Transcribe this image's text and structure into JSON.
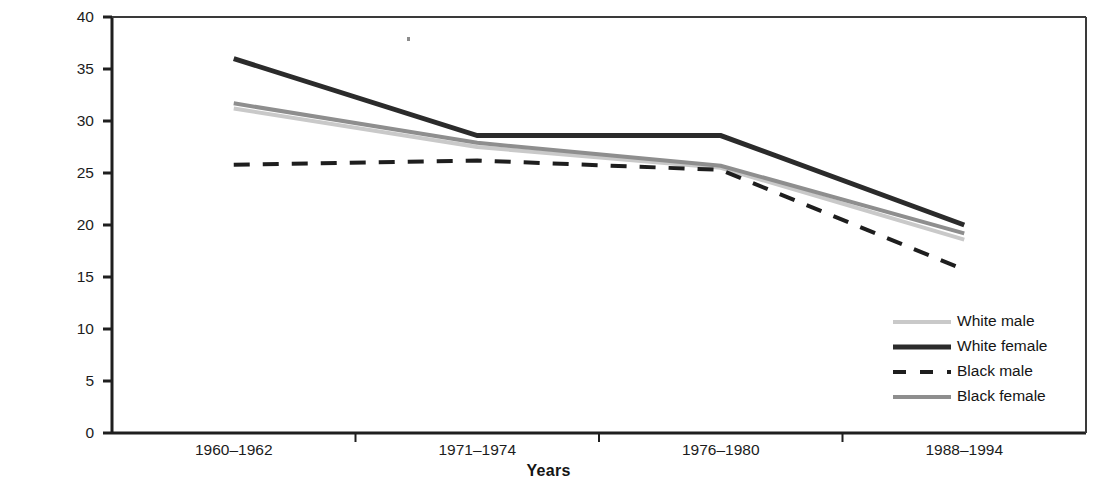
{
  "chart_data": {
    "type": "line",
    "title": "",
    "xlabel": "Years",
    "ylabel": "Percent with High Serum Cholesterol",
    "categories": [
      "1960–1962",
      "1971–1974",
      "1976–1980",
      "1988–1994"
    ],
    "ylim": [
      0,
      40
    ],
    "yticks": [
      0,
      5,
      10,
      15,
      20,
      25,
      30,
      35,
      40
    ],
    "ytick_labels": [
      "0",
      "5",
      "10",
      "15",
      "20",
      "25",
      "30",
      "35",
      "40"
    ],
    "grid": false,
    "legend_position": "lower right",
    "series": [
      {
        "name": "White male",
        "values": [
          31.2,
          27.5,
          25.5,
          18.6
        ],
        "color": "#c9c9c9",
        "style": "solid",
        "width": 4
      },
      {
        "name": "White female",
        "values": [
          36.0,
          28.6,
          28.6,
          20.0
        ],
        "color": "#2b2b2b",
        "style": "solid",
        "width": 5
      },
      {
        "name": "Black male",
        "values": [
          25.8,
          26.2,
          25.3,
          15.7
        ],
        "color": "#1e1e1e",
        "style": "dashed",
        "width": 4
      },
      {
        "name": "Black female",
        "values": [
          31.7,
          27.9,
          25.7,
          19.2
        ],
        "color": "#8e8e8e",
        "style": "solid",
        "width": 4
      }
    ]
  },
  "axes": {
    "y_axis_name": "y-axis",
    "x_axis_name": "x-axis"
  },
  "legend": {
    "items": [
      {
        "label": "White male"
      },
      {
        "label": "White female"
      },
      {
        "label": "Black male"
      },
      {
        "label": "Black female"
      }
    ]
  }
}
